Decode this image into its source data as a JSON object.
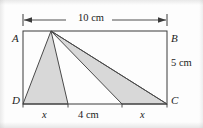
{
  "figure": {
    "kind": "geometry-diagram",
    "colors": {
      "line": "#3a3a3a",
      "shade_fill": "#d8d8d8",
      "shade_stroke": "#4a4a4a",
      "background": "#fdfdfd",
      "text": "#1c1c1c"
    },
    "vertices": [
      {
        "name": "vertex-label-a",
        "text": "A",
        "x": 12,
        "y": 34
      },
      {
        "name": "vertex-label-b",
        "text": "B",
        "x": 171,
        "y": 34
      },
      {
        "name": "vertex-label-c",
        "text": "C",
        "x": 171,
        "y": 98
      },
      {
        "name": "vertex-label-d",
        "text": "D",
        "x": 12,
        "y": 98
      }
    ],
    "dimensions": {
      "top_width": "10 cm",
      "right_height": "5 cm",
      "bottom_left_segment": "x",
      "bottom_middle_segment": "4 cm",
      "bottom_right_segment": "x"
    },
    "geometry": {
      "rect": {
        "left": 23,
        "top": 31,
        "right": 167,
        "bottom": 104
      },
      "apex": {
        "x": 51,
        "y": 31
      },
      "triangle_one": [
        [
          23,
          104
        ],
        [
          51,
          31
        ],
        [
          68,
          104
        ]
      ],
      "triangle_two": [
        [
          51,
          31
        ],
        [
          122,
          104
        ],
        [
          167,
          104
        ]
      ],
      "extra_line": [
        [
          51,
          31
        ],
        [
          167,
          104
        ]
      ],
      "dimension_line": {
        "x1": 23,
        "x2": 167,
        "y": 20
      },
      "tick_marks_bottom": [
        23,
        68,
        122,
        167
      ]
    },
    "label_positions": {
      "top_dim": {
        "x": 78,
        "y": 13
      },
      "right_dim": {
        "x": 172,
        "y": 58
      },
      "bottom_x_left": {
        "x": 41,
        "y": 110
      },
      "bottom_4cm": {
        "x": 80,
        "y": 110
      },
      "bottom_x_right": {
        "x": 140,
        "y": 110
      }
    }
  }
}
